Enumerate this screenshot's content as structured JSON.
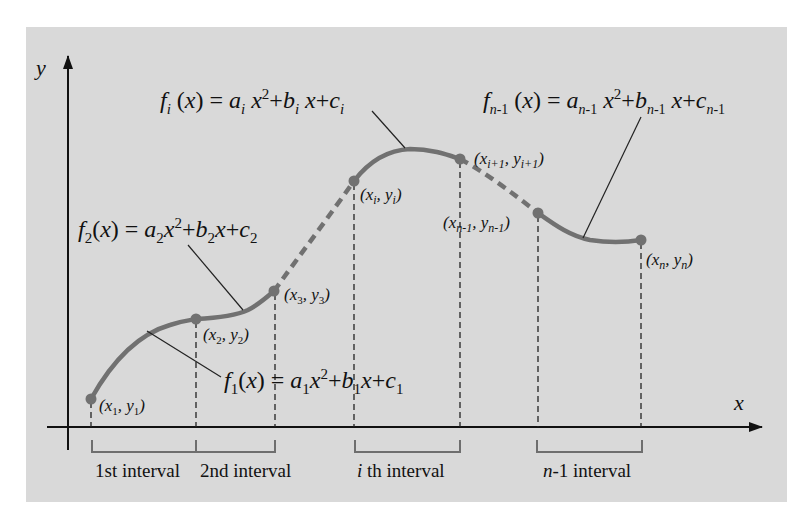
{
  "colors": {
    "background": "#ffffff",
    "panel": "#d9d9d9",
    "curve": "#717171",
    "axis": "#111111",
    "bracket": "#707070",
    "text": "#111111"
  },
  "axes": {
    "x_label": "x",
    "y_label": "y"
  },
  "equations": {
    "f1": {
      "name": "f",
      "sub": "1",
      "rhs": "a₁x²+b₁x+c₁",
      "text": "f1(x) = a1x2+b1x+c1"
    },
    "f2": {
      "name": "f",
      "sub": "2",
      "text": "f2(x) = a2x2+b2x+c2"
    },
    "fi": {
      "name": "f",
      "sub": "i",
      "text": "fi(x) = ai x2+bi x+ci"
    },
    "fn1": {
      "name": "f",
      "sub": "n-1",
      "text": "fn-1(x) = an-1 x2+bn-1 x+cn-1"
    }
  },
  "points": [
    {
      "id": "p1",
      "label": "(x1, y1)",
      "x": "x",
      "xs": "1",
      "y": "y",
      "ys": "1"
    },
    {
      "id": "p2",
      "label": "(x2, y2)",
      "x": "x",
      "xs": "2",
      "y": "y",
      "ys": "2"
    },
    {
      "id": "p3",
      "label": "(x3, y3)",
      "x": "x",
      "xs": "3",
      "y": "y",
      "ys": "3"
    },
    {
      "id": "pi",
      "label": "(xi, yi)",
      "x": "x",
      "xs": "i",
      "y": "y",
      "ys": "i"
    },
    {
      "id": "pi1",
      "label": "(xi+1, yi+1)",
      "x": "x",
      "xs": "i+1",
      "y": "y",
      "ys": "i+1"
    },
    {
      "id": "pn1",
      "label": "(xn-1, yn-1)",
      "x": "x",
      "xs": "n-1",
      "y": "y",
      "ys": "n-1"
    },
    {
      "id": "pn",
      "label": "(xn, yn)",
      "x": "x",
      "xs": "n",
      "y": "y",
      "ys": "n"
    }
  ],
  "intervals": [
    {
      "label": "1st interval"
    },
    {
      "label": "2nd interval"
    },
    {
      "label_italic": "i",
      "label_rest": " th interval",
      "label": "i th interval"
    },
    {
      "label_italic": "n",
      "label_rest": "-1 interval",
      "label": "n-1 interval"
    }
  ]
}
